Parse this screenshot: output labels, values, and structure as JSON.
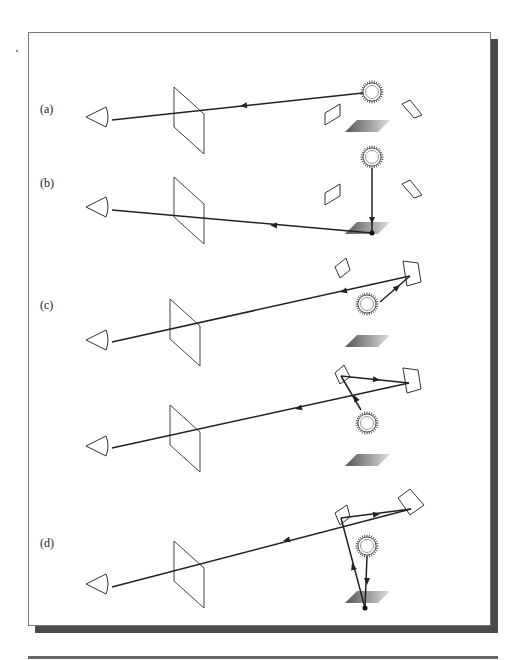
{
  "figure": {
    "panels": [
      {
        "label": "(a)",
        "label_pos": [
          40,
          113
        ],
        "eye": [
          86,
          117
        ],
        "screen": [
          174,
          87
        ],
        "light": [
          372,
          92
        ],
        "floor": [
          345,
          126
        ],
        "patches": [
          [
            [
              325,
              113
            ],
            [
              340,
              104
            ],
            [
              340,
              116
            ],
            [
              325,
              125
            ]
          ],
          [
            [
              402,
              104
            ],
            [
              410,
              100
            ],
            [
              422,
              115
            ],
            [
              414,
              118
            ]
          ]
        ],
        "rays": [
          [
            [
              372,
              92
            ],
            [
              112,
              120
            ]
          ]
        ],
        "arrows": [
          [
            [
              372,
              92
            ],
            [
              240,
              106
            ]
          ]
        ],
        "dots": []
      },
      {
        "label": "(b)",
        "label_pos": [
          40,
          187
        ],
        "eye": [
          86,
          207
        ],
        "screen": [
          174,
          177
        ],
        "light": [
          372,
          157
        ],
        "floor": [
          345,
          228
        ],
        "patches": [
          [
            [
              325,
              193
            ],
            [
              340,
              184
            ],
            [
              340,
              196
            ],
            [
              325,
              205
            ]
          ],
          [
            [
              402,
              184
            ],
            [
              410,
              180
            ],
            [
              422,
              195
            ],
            [
              414,
              198
            ]
          ]
        ],
        "rays": [
          [
            [
              372,
              233
            ],
            [
              112,
              210
            ]
          ],
          [
            [
              372,
              168
            ],
            [
              372,
              233
            ]
          ]
        ],
        "arrows": [
          [
            [
              372,
              233
            ],
            [
              270,
              225
            ]
          ],
          [
            [
              372,
              175
            ],
            [
              372,
              224
            ]
          ]
        ],
        "dots": [
          [
            372,
            233
          ]
        ]
      },
      {
        "label": "(c)",
        "label_pos": [
          40,
          309
        ],
        "eye": [
          86,
          340
        ],
        "screen": [
          170,
          299
        ],
        "light": [
          367,
          304
        ],
        "floor": [
          345,
          341
        ],
        "patches": [
          [
            [
              335,
              267
            ],
            [
              346,
              258
            ],
            [
              350,
              270
            ],
            [
              340,
              278
            ]
          ],
          [
            [
              403,
              261
            ],
            [
              418,
              263
            ],
            [
              421,
              282
            ],
            [
              407,
              286
            ]
          ]
        ],
        "rays": [
          [
            [
              410,
              276
            ],
            [
              112,
              342
            ]
          ],
          [
            [
              380,
              302
            ],
            [
              410,
              276
            ]
          ]
        ],
        "arrows": [
          [
            [
              410,
              276
            ],
            [
              340,
              292
            ]
          ],
          [
            [
              380,
              302
            ],
            [
              400,
              285
            ]
          ]
        ],
        "dots": []
      },
      {
        "label": "",
        "label_pos": [
          0,
          0
        ],
        "eye": [
          86,
          446
        ],
        "screen": [
          170,
          405
        ],
        "light": [
          367,
          423
        ],
        "floor": [
          345,
          460
        ],
        "patches": [
          [
            [
              335,
              373
            ],
            [
              344,
              365
            ],
            [
              350,
              377
            ],
            [
              340,
              384
            ]
          ],
          [
            [
              403,
              368
            ],
            [
              418,
              370
            ],
            [
              421,
              389
            ],
            [
              407,
              393
            ]
          ]
        ],
        "rays": [
          [
            [
              409,
              383
            ],
            [
              112,
              448
            ]
          ],
          [
            [
              341,
              376
            ],
            [
              409,
              383
            ]
          ],
          [
            [
              361,
              410
            ],
            [
              341,
              376
            ]
          ]
        ],
        "arrows": [
          [
            [
              409,
              383
            ],
            [
              295,
              409
            ]
          ],
          [
            [
              341,
              376
            ],
            [
              380,
              380
            ]
          ],
          [
            [
              361,
              410
            ],
            [
              354,
              395
            ]
          ]
        ],
        "dots": []
      },
      {
        "label": "(d)",
        "label_pos": [
          40,
          547
        ],
        "eye": [
          86,
          584
        ],
        "screen": [
          174,
          541
        ],
        "light": [
          367,
          546
        ],
        "floor": [
          345,
          597
        ],
        "patches": [
          [
            [
              335,
              513
            ],
            [
              347,
              505
            ],
            [
              350,
              517
            ],
            [
              340,
              525
            ]
          ],
          [
            [
              398,
              498
            ],
            [
              410,
              489
            ],
            [
              424,
              505
            ],
            [
              410,
              515
            ]
          ]
        ],
        "rays": [
          [
            [
              411,
              509
            ],
            [
              112,
              587
            ]
          ],
          [
            [
              341,
              518
            ],
            [
              411,
              509
            ]
          ],
          [
            [
              365,
              608
            ],
            [
              341,
              518
            ]
          ],
          [
            [
              367,
              556
            ],
            [
              365,
              608
            ]
          ]
        ],
        "arrows": [
          [
            [
              411,
              509
            ],
            [
              283,
              541
            ]
          ],
          [
            [
              341,
              518
            ],
            [
              380,
              514
            ]
          ],
          [
            [
              365,
              608
            ],
            [
              352,
              563
            ]
          ],
          [
            [
              367,
              565
            ],
            [
              367,
              585
            ]
          ]
        ],
        "dots": [
          [
            365,
            608
          ]
        ]
      }
    ],
    "colors": {
      "line": "#222222",
      "patch": "#333333",
      "floor_dark": "#555555",
      "floor_light": "#dddddd"
    }
  }
}
